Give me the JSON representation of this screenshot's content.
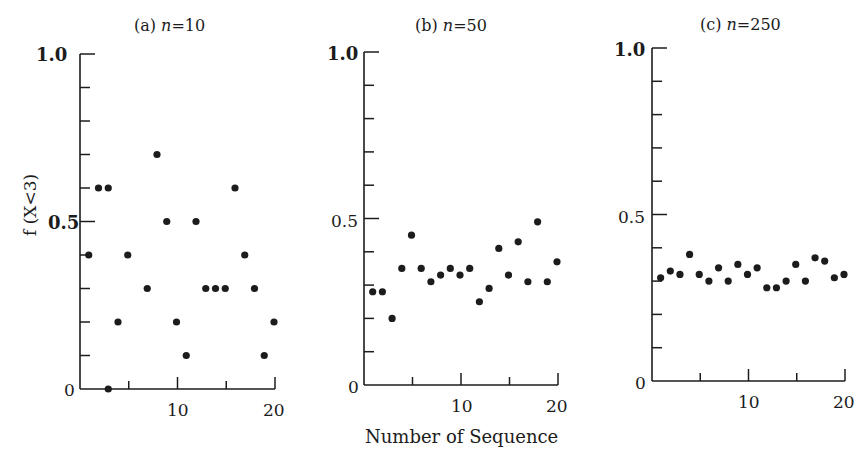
{
  "figure": {
    "xlabel": "Number of Sequence",
    "ylabel": "f (X<3)"
  },
  "chart_data": [
    {
      "type": "scatter",
      "title": "(a) n=10",
      "xlabel": "Number of Sequence",
      "ylabel": "f (X<3)",
      "xlim": [
        0,
        20
      ],
      "ylim": [
        0,
        1.0
      ],
      "x_ticks": [
        5,
        10,
        15,
        20
      ],
      "x_tick_labels": [
        "10",
        "20"
      ],
      "y_ticks": [
        0,
        0.1,
        0.2,
        0.3,
        0.4,
        0.5,
        0.6,
        0.7,
        0.8,
        0.9,
        1.0
      ],
      "y_tick_labels": [
        "0",
        "0.5",
        "1.0"
      ],
      "grid": false,
      "x": [
        1,
        2,
        3,
        3,
        4,
        5,
        7,
        8,
        9,
        10,
        11,
        12,
        13,
        14,
        15,
        16,
        17,
        18,
        19,
        20
      ],
      "y": [
        0.4,
        0.6,
        0.6,
        0.0,
        0.2,
        0.4,
        0.3,
        0.7,
        0.5,
        0.2,
        0.1,
        0.5,
        0.3,
        0.3,
        0.3,
        0.6,
        0.4,
        0.3,
        0.1,
        0.2
      ]
    },
    {
      "type": "scatter",
      "title": "(b) n=50",
      "xlabel": "Number of Sequence",
      "ylabel": "f (X<3)",
      "xlim": [
        0,
        20
      ],
      "ylim": [
        0,
        1.0
      ],
      "x_ticks": [
        5,
        10,
        15,
        20
      ],
      "x_tick_labels": [
        "10",
        "20"
      ],
      "y_ticks": [
        0,
        0.1,
        0.2,
        0.3,
        0.4,
        0.5,
        0.6,
        0.7,
        0.8,
        0.9,
        1.0
      ],
      "y_tick_labels": [
        "0",
        "0.5",
        "1.0"
      ],
      "grid": false,
      "x": [
        1,
        2,
        3,
        4,
        5,
        6,
        7,
        8,
        9,
        10,
        11,
        12,
        13,
        14,
        15,
        16,
        17,
        18,
        19,
        20
      ],
      "y": [
        0.28,
        0.28,
        0.2,
        0.35,
        0.45,
        0.35,
        0.31,
        0.33,
        0.35,
        0.33,
        0.35,
        0.25,
        0.29,
        0.41,
        0.33,
        0.43,
        0.31,
        0.49,
        0.31,
        0.37
      ]
    },
    {
      "type": "scatter",
      "title": "(c) n=250",
      "xlabel": "Number of Sequence",
      "ylabel": "f (X<3)",
      "xlim": [
        0,
        20
      ],
      "ylim": [
        0,
        1.0
      ],
      "x_ticks": [
        5,
        10,
        15,
        20
      ],
      "x_tick_labels": [
        "10",
        "20"
      ],
      "y_ticks": [
        0,
        0.1,
        0.2,
        0.3,
        0.4,
        0.5,
        0.6,
        0.7,
        0.8,
        0.9,
        1.0
      ],
      "y_tick_labels": [
        "0",
        "0.5",
        "1.0"
      ],
      "grid": false,
      "x": [
        1,
        2,
        3,
        4,
        5,
        6,
        7,
        8,
        9,
        10,
        11,
        12,
        13,
        14,
        15,
        16,
        17,
        18,
        19,
        20
      ],
      "y": [
        0.31,
        0.33,
        0.32,
        0.38,
        0.32,
        0.3,
        0.34,
        0.3,
        0.35,
        0.32,
        0.34,
        0.28,
        0.28,
        0.3,
        0.35,
        0.3,
        0.37,
        0.36,
        0.31,
        0.32
      ]
    }
  ],
  "panels": [
    {
      "title_prefix": "(a) ",
      "title_n": "n",
      "title_value": "=10",
      "y_top_label": "1.0",
      "y_mid_label": "0.5",
      "y_zero_label": "0",
      "x_label_10": "10",
      "x_label_20": "20"
    },
    {
      "title_prefix": "(b) ",
      "title_n": "n",
      "title_value": "=50",
      "y_top_label": "1.0",
      "y_mid_label": "0.5",
      "y_zero_label": "0",
      "x_label_10": "10",
      "x_label_20": "20"
    },
    {
      "title_prefix": "(c) ",
      "title_n": "n",
      "title_value": "=250",
      "y_top_label": "1.0",
      "y_mid_label": "0.5",
      "y_zero_label": "0",
      "x_label_10": "10",
      "x_label_20": "20"
    }
  ],
  "style": {
    "ink_color": "#1c1c1c",
    "background": "#ffffff"
  }
}
